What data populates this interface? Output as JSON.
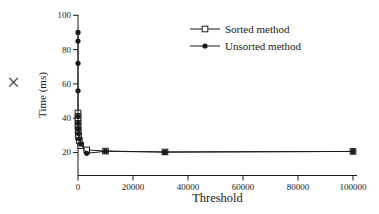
{
  "figure": {
    "x_mark_glyph": "×"
  },
  "chart_data": {
    "type": "line",
    "title": "",
    "xlabel": "Threshold",
    "ylabel": "Time (ms)",
    "xlim": [
      0,
      100000
    ],
    "ylim": [
      6.5,
      100
    ],
    "x_ticks": [
      "0",
      "20000",
      "40000",
      "60000",
      "80000",
      "100000"
    ],
    "x_tick_values": [
      0,
      20000,
      40000,
      60000,
      80000,
      100000
    ],
    "y_ticks": [
      "20",
      "40",
      "60",
      "80",
      "100"
    ],
    "y_tick_values": [
      20,
      40,
      60,
      80,
      100
    ],
    "grid": false,
    "legend_position": "upper-right-inside",
    "axis_color": "#1a1a1a",
    "x": [
      1,
      2,
      5,
      10,
      20,
      50,
      100,
      200,
      500,
      1000,
      3162,
      10000,
      31623,
      100000
    ],
    "series": [
      {
        "name": "Sorted method",
        "marker": "open-square",
        "color": "#1a1a1a",
        "values": [
          43,
          41,
          39,
          37,
          35,
          33,
          31,
          29,
          27,
          24,
          21.5,
          20.8,
          20.3,
          20.6
        ]
      },
      {
        "name": "Unsorted method",
        "marker": "filled-circle",
        "color": "#1a1a1a",
        "values": [
          90,
          85,
          72,
          56,
          41,
          37,
          34,
          31,
          28,
          25,
          19.5,
          20.7,
          20.2,
          20.6
        ]
      }
    ]
  }
}
